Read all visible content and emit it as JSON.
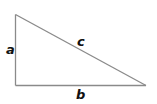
{
  "diagram": {
    "type": "right-triangle",
    "vertices": {
      "top": [
        15.5,
        14.5
      ],
      "right_angle": [
        15.5,
        85.5
      ],
      "bottom_right": [
        146,
        85.5
      ]
    },
    "stroke_color": "#8a8a8a",
    "label_color": "#111111",
    "labels": {
      "a": "a",
      "b": "b",
      "c": "c"
    }
  }
}
